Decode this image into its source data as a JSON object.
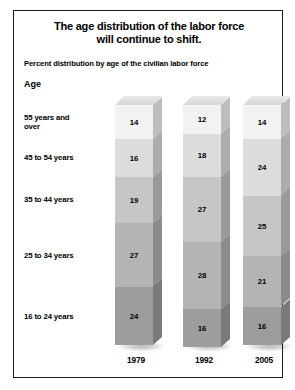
{
  "chart_data": {
    "type": "bar",
    "subtype": "stacked-column-3d",
    "title": "The age distribution of the labor force will continue to shift.",
    "title_lines": [
      "The age distribution of the labor force",
      "will continue to shift."
    ],
    "subtitle": "Percent distribution by age of the civilian labor force",
    "xlabel": "",
    "ylabel": "",
    "axis_label_left": "Age",
    "categories": [
      "1979",
      "1992",
      "2005"
    ],
    "ylim": [
      0,
      100
    ],
    "grid": false,
    "legend": "left-axis-labels",
    "units": "percent",
    "series": [
      {
        "name": "55 years and over",
        "values": [
          14,
          12,
          14
        ],
        "color": "#f2f2f2"
      },
      {
        "name": "45 to 54 years",
        "values": [
          16,
          18,
          24
        ],
        "color": "#dcdcdc"
      },
      {
        "name": "35 to 44 years",
        "values": [
          19,
          27,
          25
        ],
        "color": "#c6c6c6"
      },
      {
        "name": "25 to 34 years",
        "values": [
          27,
          28,
          21
        ],
        "color": "#b4b4b4"
      },
      {
        "name": "16 to 24 years",
        "values": [
          24,
          16,
          16
        ],
        "color": "#9d9d9d"
      }
    ]
  },
  "header": {
    "title_line1": "The age distribution of the labor force",
    "title_line2": "will continue to shift.",
    "subtitle": "Percent distribution by age of the civilian labor force",
    "age_header": "Age"
  },
  "age_labels": [
    {
      "line1": "55 years and",
      "line2": "over"
    },
    {
      "line1": "45 to 54 years",
      "line2": ""
    },
    {
      "line1": "35 to 44 years",
      "line2": ""
    },
    {
      "line1": "25 to 34 years",
      "line2": ""
    },
    {
      "line1": "16 to 24 years",
      "line2": ""
    }
  ],
  "bars": [
    {
      "year": "1979",
      "values": [
        "14",
        "16",
        "19",
        "27",
        "24"
      ]
    },
    {
      "year": "1992",
      "values": [
        "12",
        "18",
        "27",
        "28",
        "16"
      ]
    },
    {
      "year": "2005",
      "values": [
        "14",
        "24",
        "25",
        "21",
        "16"
      ]
    }
  ],
  "colors": {
    "seg_55_over": "#f2f2f2",
    "seg_45_54": "#dcdcdc",
    "seg_35_44": "#c6c6c6",
    "seg_25_34": "#b4b4b4",
    "seg_16_24": "#9d9d9d",
    "frame_border": "#1c1c1c",
    "background": "#ffffff",
    "text": "#000000"
  }
}
